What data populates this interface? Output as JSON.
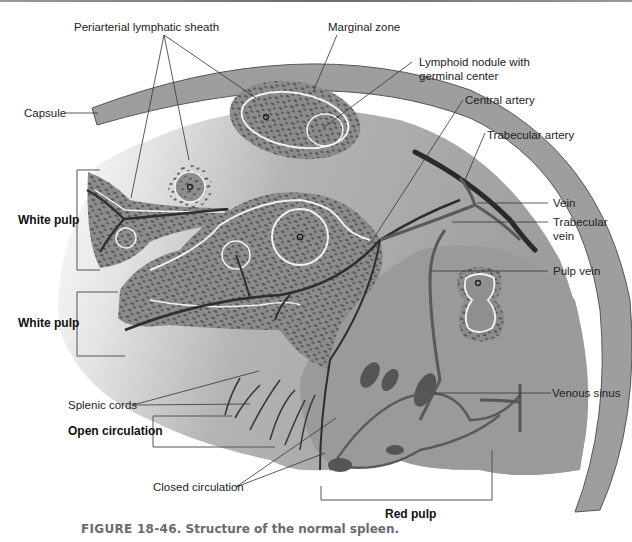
{
  "figure": {
    "number_label": "FIGURE 18-46.",
    "caption": "Structure of the normal spleen."
  },
  "labels": {
    "periarterial_sheath": "Periarterial lymphatic sheath",
    "marginal_zone": "Marginal zone",
    "lymphoid_nodule_line1": "Lymphoid nodule with",
    "lymphoid_nodule_line2": "germinal center",
    "capsule": "Capsule",
    "central_artery": "Central artery",
    "trabecular_artery": "Trabecular artery",
    "vein": "Vein",
    "trabecular_vein_line1": "Trabecular",
    "trabecular_vein_line2": "vein",
    "pulp_vein": "Pulp vein",
    "white_pulp_upper": "White pulp",
    "white_pulp_lower": "White pulp",
    "splenic_cords": "Splenic cords",
    "open_circulation": "Open circulation",
    "closed_circulation": "Closed circulation",
    "venous_sinus": "Venous sinus",
    "red_pulp": "Red pulp"
  },
  "colors": {
    "capsule": "#9e9e9e",
    "parenchyma": "#a8a8a8",
    "cell_dots": "#5e5e5e",
    "vessel": "#3a3a3a",
    "vein": "#5a5a5a",
    "marginal_ring": "#f2f2f2",
    "leader_line": "#333333",
    "caption": "#6b6b6b"
  }
}
